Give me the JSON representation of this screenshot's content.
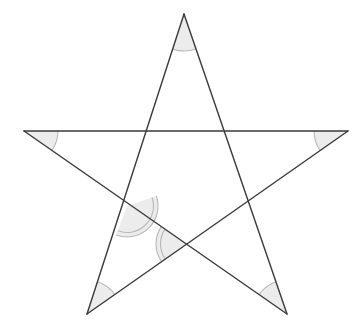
{
  "figure": {
    "type": "geometry-diagram",
    "canvas": {
      "width": 362,
      "height": 332,
      "background": "#ffffff"
    },
    "style": {
      "line_color": "#3a3a3a",
      "line_width": 1.4,
      "arc_fill": "#ececec",
      "arc_stroke": "#b8b8b8",
      "arc_stroke_width": 1.1
    },
    "points": {
      "top": {
        "label": "T",
        "x": 184,
        "y": 14
      },
      "left": {
        "label": "L",
        "x": 24,
        "y": 131
      },
      "right": {
        "label": "R",
        "x": 348,
        "y": 131
      },
      "bottom_left": {
        "label": "BL",
        "x": 87,
        "y": 314
      },
      "bottom_right": {
        "label": "BR",
        "x": 287,
        "y": 314
      }
    },
    "edges": [
      {
        "name": "top-to-bottom-left",
        "from": "top",
        "to": "bottom_left"
      },
      {
        "name": "top-to-bottom-right",
        "from": "top",
        "to": "bottom_right"
      },
      {
        "name": "left-to-right",
        "from": "left",
        "to": "right"
      },
      {
        "name": "left-to-bottom-right",
        "from": "left",
        "to": "bottom_right"
      },
      {
        "name": "right-to-bottom-left",
        "from": "right",
        "to": "bottom_left"
      }
    ],
    "point_angle_marks": [
      {
        "name": "angle-top",
        "vertex": "top",
        "radius": 37,
        "rings": 1
      },
      {
        "name": "angle-left",
        "vertex": "left",
        "radius": 34,
        "rings": 1
      },
      {
        "name": "angle-right",
        "vertex": "right",
        "radius": 34,
        "rings": 1
      },
      {
        "name": "angle-bottom-left",
        "vertex": "bottom_left",
        "radius": 34,
        "rings": 1
      },
      {
        "name": "angle-bottom-right",
        "vertex": "bottom_right",
        "radius": 34,
        "rings": 1
      }
    ],
    "interior_angle_marks": [
      {
        "name": "angle-inner-upper-left",
        "vertex_x": 127,
        "vertex_y": 206,
        "radius": 31,
        "rings": 2,
        "ray_a_x": 348,
        "ray_a_y": 131,
        "ray_b_x": 87,
        "ray_b_y": 314
      },
      {
        "name": "angle-inner-lower",
        "vertex_x": 187,
        "vertex_y": 244,
        "radius": 31,
        "rings": 2,
        "ray_a_x": 24,
        "ray_a_y": 131,
        "ray_b_x": 87,
        "ray_b_y": 314
      }
    ]
  }
}
